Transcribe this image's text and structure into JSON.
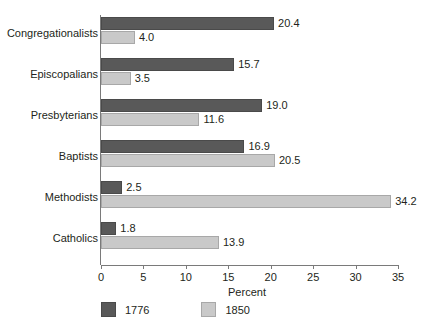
{
  "chart_data": {
    "type": "bar",
    "orientation": "horizontal",
    "title": "",
    "xlabel": "Percent",
    "ylabel": "",
    "xlim": [
      0,
      35
    ],
    "xticks": [
      0,
      5,
      10,
      15,
      20,
      25,
      30,
      35
    ],
    "grid": false,
    "legend_position": "bottom-left",
    "categories": [
      "Congregationalists",
      "Episcopalians",
      "Presbyterians",
      "Baptists",
      "Methodists",
      "Catholics"
    ],
    "series": [
      {
        "name": "1776",
        "color": "#595959",
        "values": [
          20.4,
          15.7,
          19.0,
          16.9,
          2.5,
          1.8
        ],
        "labels": [
          "20.4",
          "15.7",
          "19.0",
          "16.9",
          "2.5",
          "1.8"
        ]
      },
      {
        "name": "1850",
        "color": "#c9c9c9",
        "values": [
          4.0,
          3.5,
          11.6,
          20.5,
          34.2,
          13.9
        ],
        "labels": [
          "4.0",
          "3.5",
          "11.6",
          "20.5",
          "34.2",
          "13.9"
        ]
      }
    ]
  },
  "axis": {
    "x_title": "Percent",
    "tick_labels": [
      "0",
      "5",
      "10",
      "15",
      "20",
      "25",
      "30",
      "35"
    ]
  },
  "legend": {
    "entries": [
      {
        "label": "1776"
      },
      {
        "label": "1850"
      }
    ]
  }
}
